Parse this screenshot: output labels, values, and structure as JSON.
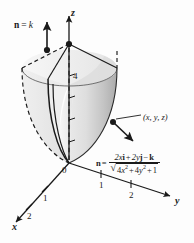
{
  "figure": {
    "kind": "3d-vector-calculus-diagram",
    "background_color": "#fdfdfd",
    "ink_color": "#1a1a1a",
    "surface_fill_light": "#ededed",
    "surface_fill_mid": "#d9d9d9",
    "surface_fill_dark": "#b4b4b4"
  },
  "axes": {
    "x_label": "x",
    "y_label": "y",
    "z_label": "z",
    "origin_label": "0",
    "x_ticks": [
      "1",
      "2"
    ],
    "y_ticks": [
      "1",
      "2"
    ],
    "z_value_label": "4"
  },
  "annotations": {
    "top_normal": {
      "n_symbol": "n",
      "equals": "=",
      "value": "k",
      "full_text": "n = k"
    },
    "point_label": "(x, y, z)"
  },
  "formula": {
    "n_symbol": "n",
    "equals": "=",
    "numerator": "2xi + 2yj − k",
    "numerator_parts": {
      "term1_coef": "2",
      "term1_var": "x",
      "term1_unit": "i",
      "plus1": "+",
      "term2_coef": "2",
      "term2_var": "y",
      "term2_unit": "j",
      "minus": "−",
      "term3_unit": "k"
    },
    "denominator": "√(4x² + 4y² + 1)",
    "denominator_parts": {
      "radical": "√",
      "t1_coef": "4",
      "t1_var": "x",
      "t1_pow": "2",
      "plus1": "+",
      "t2_coef": "4",
      "t2_var": "y",
      "t2_pow": "2",
      "plus2": "+",
      "const": "1"
    }
  }
}
